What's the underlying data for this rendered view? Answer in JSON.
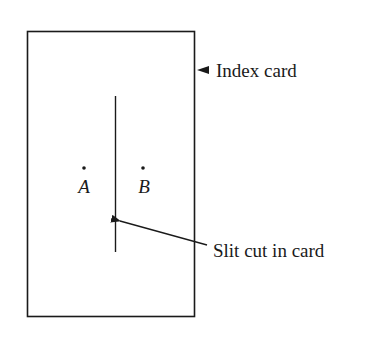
{
  "diagram": {
    "card_label": "Index card",
    "slit_label": "Slit cut in card",
    "points": [
      {
        "id": "A",
        "label": "A"
      },
      {
        "id": "B",
        "label": "B"
      }
    ],
    "colors": {
      "stroke": "#1a1a1a",
      "background": "#ffffff"
    }
  }
}
